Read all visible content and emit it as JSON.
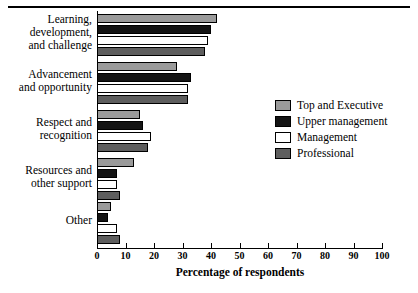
{
  "chart_data": {
    "type": "bar",
    "orientation": "horizontal",
    "title": "",
    "xlabel": "Percentage of respondents",
    "ylabel": "",
    "xlim": [
      0,
      100
    ],
    "xticks": [
      0,
      10,
      20,
      30,
      40,
      50,
      60,
      70,
      80,
      90,
      100
    ],
    "grid": false,
    "legend_position": "right",
    "categories": [
      "Learning, development, and challenge",
      "Advancement and opportunity",
      "Respect and recognition",
      "Resources and other support",
      "Other"
    ],
    "series": [
      {
        "name": "Top and Executive",
        "color": "#9a9a9a",
        "values": [
          42,
          28,
          15,
          13,
          5
        ]
      },
      {
        "name": "Upper management",
        "color": "#141414",
        "values": [
          40,
          33,
          16,
          7,
          4
        ]
      },
      {
        "name": "Management",
        "color": "#ffffff",
        "values": [
          39,
          32,
          19,
          7,
          7
        ]
      },
      {
        "name": "Professional",
        "color": "#5e5e5e",
        "values": [
          38,
          32,
          18,
          8,
          8
        ]
      }
    ]
  },
  "axis": {
    "xlabel": "Percentage of respondents",
    "tick_labels": [
      "0",
      "10",
      "20",
      "30",
      "40",
      "50",
      "60",
      "70",
      "80",
      "90",
      "100"
    ]
  },
  "categories": {
    "c0_line1": "Learning,",
    "c0_line2": "development,",
    "c0_line3": "and challenge",
    "c1_line1": "Advancement",
    "c1_line2": "and opportunity",
    "c2_line1": "Respect and",
    "c2_line2": "recognition",
    "c3_line1": "Resources and",
    "c3_line2": "other support",
    "c4_line1": "Other"
  },
  "legend": {
    "items": [
      {
        "label": "Top and Executive",
        "color": "#9a9a9a"
      },
      {
        "label": "Upper management",
        "color": "#141414"
      },
      {
        "label": "Management",
        "color": "#ffffff"
      },
      {
        "label": "Professional",
        "color": "#5e5e5e"
      }
    ]
  }
}
